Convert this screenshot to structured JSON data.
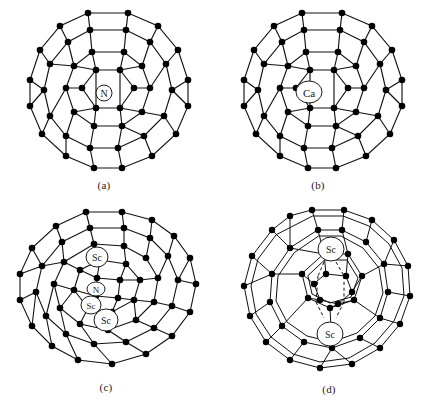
{
  "figure": {
    "background_color": "#ffffff",
    "line_color": "#111111",
    "vertex_color": "#000000",
    "label_color": "#1a1a1a"
  },
  "panels": [
    {
      "id": "a",
      "caption": "(a)",
      "cage": "C60 fullerene cage, truncated-icosahedron net, single-line bonds",
      "encapsulated": [
        {
          "label": "N",
          "cx": 104,
          "cy": 93,
          "rx": 8,
          "ry": 8,
          "font_size": 10
        }
      ]
    },
    {
      "id": "b",
      "caption": "(b)",
      "cage": "C60 fullerene cage, truncated-icosahedron net, single-line bonds",
      "encapsulated": [
        {
          "label": "Ca",
          "cx": 309,
          "cy": 92,
          "rx": 13,
          "ry": 11,
          "font_size": 11
        }
      ]
    },
    {
      "id": "c",
      "caption": "(c)",
      "cage": "C80 fullerene cage, single-line bonds",
      "encapsulated": [
        {
          "label": "Sc",
          "cx": 97,
          "cy": 257,
          "rx": 11,
          "ry": 10,
          "font_size": 10
        },
        {
          "label": "N",
          "cx": 96,
          "cy": 289,
          "rx": 9,
          "ry": 7,
          "font_size": 9
        },
        {
          "label": "Sc",
          "cx": 91,
          "cy": 305,
          "rx": 10,
          "ry": 9,
          "font_size": 9
        },
        {
          "label": "Sc",
          "cx": 106,
          "cy": 320,
          "rx": 12,
          "ry": 11,
          "font_size": 10
        }
      ]
    },
    {
      "id": "d",
      "caption": "(d)",
      "cage": "C84 fullerene cage, double-line bonds with dashed coordination bonds",
      "encapsulated": [
        {
          "label": "Sc",
          "cx": 331,
          "cy": 249,
          "rx": 13,
          "ry": 12,
          "font_size": 10
        },
        {
          "label": "Sc",
          "cx": 330,
          "cy": 334,
          "rx": 13,
          "ry": 12,
          "font_size": 10
        }
      ]
    }
  ],
  "captions": {
    "a": "(a)",
    "b": "(b)",
    "c": "(c)",
    "d": "(d)"
  }
}
